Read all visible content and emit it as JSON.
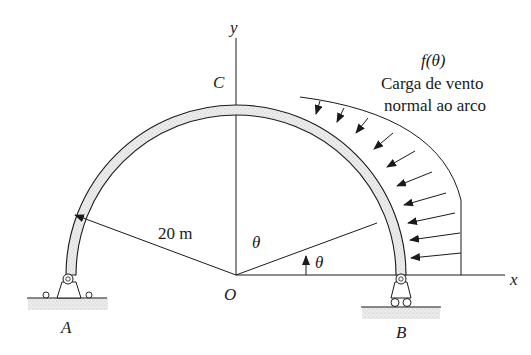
{
  "diagram": {
    "type": "semicircular-arch-with-wind-load",
    "labels": {
      "y_axis": "y",
      "x_axis": "x",
      "crown": "C",
      "origin": "O",
      "support_left": "A",
      "support_right": "B",
      "radius": "20 m",
      "angle_inner": "θ",
      "angle_arrow": "θ",
      "load_function": "f(θ)",
      "load_desc_line1": "Carga de vento",
      "load_desc_line2": "normal ao arco"
    },
    "supports": {
      "A": "pin",
      "B": "roller"
    },
    "load_arrows_count": 10,
    "colors": {
      "line": "#1a1a1a",
      "arch_fill": "#e6e6e6",
      "ground_fill": "#e8e8e8"
    }
  }
}
